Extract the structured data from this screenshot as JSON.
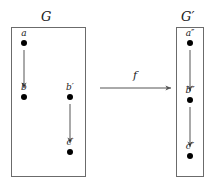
{
  "figure": {
    "type": "graph-homomorphism-diagram",
    "background": "#ffffff",
    "line_color": "#555555",
    "box_color": "#6b6b6b",
    "vertex_color": "#000000",
    "text_color": "#1a1a1a"
  },
  "left_graph": {
    "name": "G",
    "vertices": [
      {
        "id": "a",
        "label": "a",
        "x": 24,
        "y": 43
      },
      {
        "id": "b",
        "label": "b",
        "x": 24,
        "y": 97
      },
      {
        "id": "bp",
        "label": "b′",
        "x": 70,
        "y": 97
      },
      {
        "id": "cp",
        "label": "c′",
        "x": 70,
        "y": 152
      }
    ],
    "edges": [
      {
        "from": "a",
        "to": "b",
        "directed": true
      },
      {
        "from": "bp",
        "to": "cp",
        "directed": true
      }
    ]
  },
  "right_graph": {
    "name": "G′",
    "vertices": [
      {
        "id": "app",
        "label": "a″",
        "x": 190,
        "y": 43
      },
      {
        "id": "bpp",
        "label": "b″",
        "x": 190,
        "y": 100
      },
      {
        "id": "cpp",
        "label": "c″",
        "x": 190,
        "y": 156
      }
    ],
    "edges": [
      {
        "from": "app",
        "to": "bpp",
        "directed": true
      },
      {
        "from": "bpp",
        "to": "cpp",
        "directed": true
      }
    ]
  },
  "map_arrow": {
    "label": "f",
    "x1": 100,
    "y1": 88,
    "x2": 172,
    "y2": 88
  }
}
